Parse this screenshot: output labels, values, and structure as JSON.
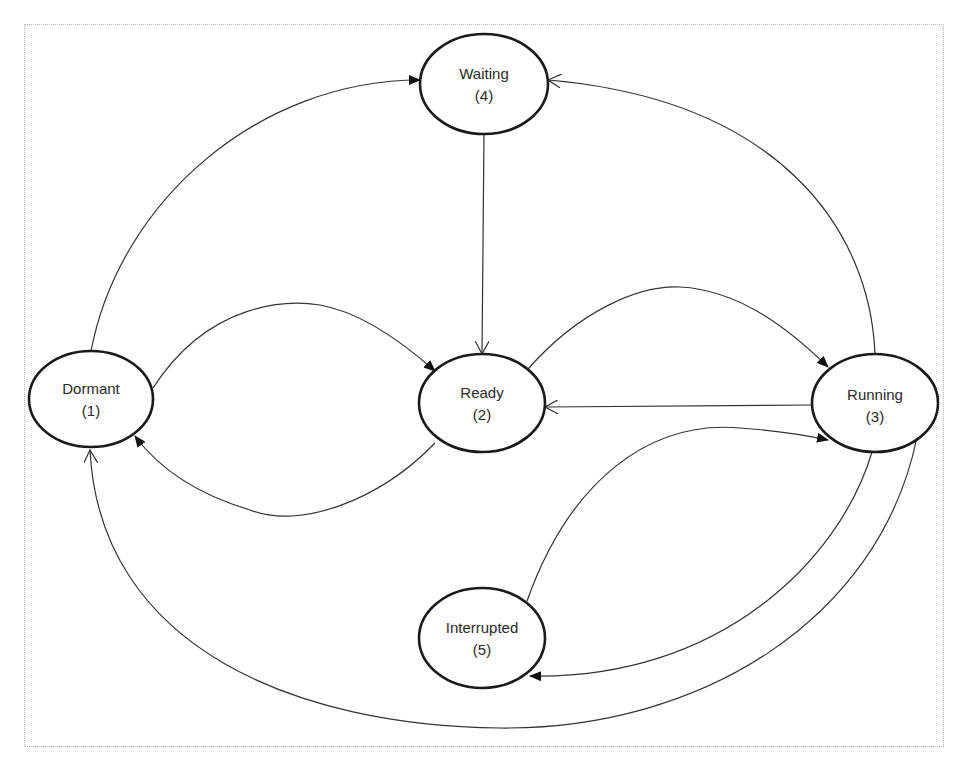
{
  "diagram": {
    "type": "state-transition",
    "nodes": [
      {
        "id": "dormant",
        "name": "Dormant",
        "number": "(1)"
      },
      {
        "id": "ready",
        "name": "Ready",
        "number": "(2)"
      },
      {
        "id": "running",
        "name": "Running",
        "number": "(3)"
      },
      {
        "id": "waiting",
        "name": "Waiting",
        "number": "(4)"
      },
      {
        "id": "interrupted",
        "name": "Interrupted",
        "number": "(5)"
      }
    ],
    "edges": [
      {
        "from": "Dormant",
        "to": "Waiting",
        "arrow": "filled"
      },
      {
        "from": "Dormant",
        "to": "Ready",
        "arrow": "filled"
      },
      {
        "from": "Ready",
        "to": "Dormant",
        "arrow": "filled"
      },
      {
        "from": "Waiting",
        "to": "Ready",
        "arrow": "open"
      },
      {
        "from": "Ready",
        "to": "Running",
        "arrow": "filled"
      },
      {
        "from": "Running",
        "to": "Ready",
        "arrow": "open"
      },
      {
        "from": "Running",
        "to": "Waiting",
        "arrow": "open"
      },
      {
        "from": "Interrupted",
        "to": "Running",
        "arrow": "filled"
      },
      {
        "from": "Running",
        "to": "Interrupted",
        "arrow": "filled"
      },
      {
        "from": "Running",
        "to": "Dormant",
        "arrow": "open"
      }
    ],
    "colors": {
      "node_stroke": "#1a1a1a",
      "edge_stroke": "#333333",
      "text": "#2a2a2a",
      "background": "#ffffff",
      "frame": "#b8b8b8"
    }
  }
}
